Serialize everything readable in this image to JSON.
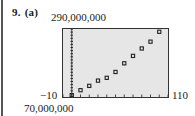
{
  "problem": {
    "number": "9.",
    "part": "(a)"
  },
  "window": {
    "xmin_label": "−10",
    "xmax_label": "110",
    "ymin_label": "70,000,000",
    "ymax_label": "290,000,000"
  },
  "colors": {
    "screen_bg": "#e6e6e6",
    "point": "#222222",
    "frame": "#333333"
  },
  "chart_data": {
    "type": "scatter",
    "title": "",
    "xlabel": "",
    "ylabel": "",
    "xlim": [
      -10,
      110
    ],
    "ylim": [
      70000000,
      290000000
    ],
    "grid": false,
    "x_tick_step": 10,
    "y_tick_step": 10000000,
    "x": [
      0,
      10,
      20,
      30,
      40,
      50,
      60,
      70,
      80,
      90,
      100
    ],
    "y": [
      76000000,
      92000000,
      106000000,
      123000000,
      132000000,
      151000000,
      179000000,
      203000000,
      227000000,
      249000000,
      281000000
    ]
  }
}
